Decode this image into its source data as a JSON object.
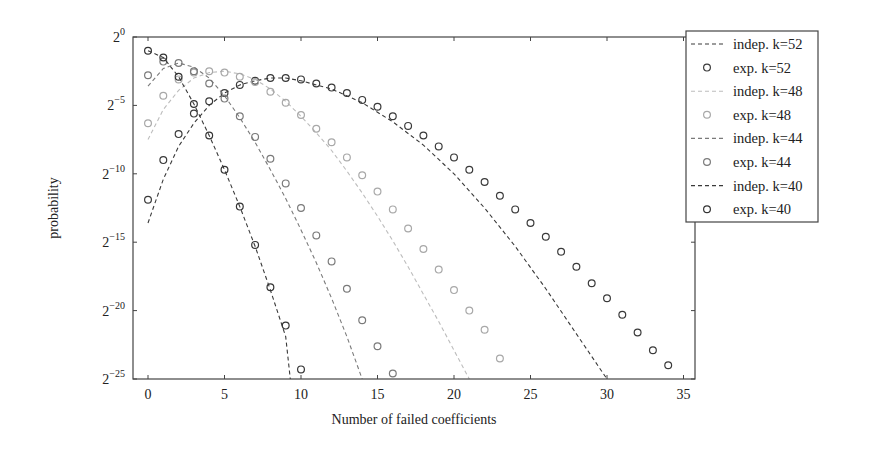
{
  "chart_data": {
    "type": "scatter",
    "title": "",
    "xlabel": "Number of failed coefficients",
    "ylabel": "probability",
    "xlim": [
      -1,
      35.5
    ],
    "ylim_log2": [
      -25,
      0
    ],
    "y_scale": "log2",
    "x_ticks": [
      0,
      5,
      10,
      15,
      20,
      25,
      30,
      35
    ],
    "y_ticks": [
      0,
      -5,
      -10,
      -15,
      -20,
      -25
    ],
    "y_tick_labels": [
      "2^0",
      "2^-5",
      "2^-10",
      "2^-15",
      "2^-20",
      "2^-25"
    ],
    "grid": false,
    "legend_position": "outside-top-right",
    "series": [
      {
        "name": "indep. k=52",
        "kind": "dashed-line",
        "color": "#3a3a3a",
        "x": [
          0,
          1,
          2,
          3,
          4,
          5,
          6,
          7,
          8,
          9,
          10,
          12,
          14,
          16,
          18,
          20,
          22,
          24,
          26,
          28,
          30
        ],
        "log2y": [
          -13.6,
          -10.4,
          -8.0,
          -6.3,
          -5.0,
          -4.1,
          -3.5,
          -3.2,
          -3.0,
          -3.0,
          -3.2,
          -3.8,
          -4.8,
          -6.2,
          -7.9,
          -10.0,
          -12.5,
          -15.3,
          -18.4,
          -21.7,
          -25.0
        ]
      },
      {
        "name": "exp. k=52",
        "kind": "circles",
        "color": "#3a3a3a",
        "x": [
          0,
          1,
          2,
          3,
          4,
          5,
          6,
          7,
          8,
          9,
          10,
          11,
          12,
          13,
          14,
          15,
          16,
          17,
          18,
          19,
          20,
          21,
          22,
          23,
          24,
          25,
          26,
          27,
          28,
          29,
          30,
          31,
          32,
          33,
          34
        ],
        "log2y": [
          -11.9,
          -9.0,
          -7.1,
          -5.6,
          -4.7,
          -4.1,
          -3.5,
          -3.2,
          -3.0,
          -3.0,
          -3.1,
          -3.4,
          -3.7,
          -4.1,
          -4.6,
          -5.1,
          -5.8,
          -6.5,
          -7.2,
          -8.0,
          -8.8,
          -9.7,
          -10.6,
          -11.6,
          -12.6,
          -13.6,
          -14.6,
          -15.7,
          -16.8,
          -18.0,
          -19.1,
          -20.3,
          -21.6,
          -22.9,
          -24.0
        ]
      },
      {
        "name": "indep. k=48",
        "kind": "dashed-line",
        "color": "#bdbdbd",
        "x": [
          0,
          1,
          2,
          3,
          4,
          5,
          6,
          7,
          8,
          9,
          10,
          11,
          12,
          13,
          14,
          15,
          16,
          17,
          18,
          19,
          20,
          21
        ],
        "log2y": [
          -7.5,
          -5.3,
          -3.9,
          -3.0,
          -2.6,
          -2.5,
          -2.7,
          -3.1,
          -3.8,
          -4.7,
          -5.8,
          -7.0,
          -8.3,
          -9.8,
          -11.4,
          -13.1,
          -14.9,
          -16.8,
          -18.8,
          -20.8,
          -22.9,
          -25.0
        ]
      },
      {
        "name": "exp. k=48",
        "kind": "circles",
        "color": "#a8a8a8",
        "x": [
          0,
          1,
          2,
          3,
          4,
          5,
          6,
          7,
          8,
          9,
          10,
          11,
          12,
          13,
          14,
          15,
          16,
          17,
          18,
          19,
          20,
          21,
          22,
          23
        ],
        "log2y": [
          -6.3,
          -4.3,
          -3.1,
          -2.6,
          -2.5,
          -2.6,
          -2.9,
          -3.3,
          -4.0,
          -4.8,
          -5.7,
          -6.7,
          -7.7,
          -8.8,
          -10.1,
          -11.3,
          -12.6,
          -14.0,
          -15.5,
          -17.0,
          -18.5,
          -20.0,
          -21.4,
          -23.5
        ]
      },
      {
        "name": "indep. k=44",
        "kind": "dashed-line",
        "color": "#7a7a7a",
        "x": [
          0,
          1,
          2,
          3,
          4,
          5,
          6,
          7,
          8,
          9,
          10,
          11,
          12,
          13,
          14
        ],
        "log2y": [
          -3.6,
          -2.3,
          -1.9,
          -2.2,
          -3.0,
          -4.3,
          -5.9,
          -7.7,
          -9.7,
          -11.8,
          -14.1,
          -16.5,
          -19.1,
          -21.9,
          -25.0
        ]
      },
      {
        "name": "exp. k=44",
        "kind": "circles",
        "color": "#7a7a7a",
        "x": [
          0,
          1,
          2,
          3,
          4,
          5,
          6,
          7,
          8,
          9,
          10,
          11,
          12,
          13,
          14,
          15,
          16
        ],
        "log2y": [
          -2.8,
          -1.8,
          -1.9,
          -2.5,
          -3.4,
          -4.5,
          -5.8,
          -7.3,
          -8.9,
          -10.7,
          -12.5,
          -14.5,
          -16.4,
          -18.4,
          -20.7,
          -22.6,
          -24.6
        ]
      },
      {
        "name": "indep. k=40",
        "kind": "dashed-line",
        "color": "#3a3a3a",
        "x": [
          0,
          1,
          2,
          3,
          4,
          5,
          6,
          7,
          8,
          9,
          9.3
        ],
        "log2y": [
          -1.0,
          -1.5,
          -2.9,
          -4.9,
          -7.2,
          -9.7,
          -12.4,
          -15.3,
          -18.5,
          -21.9,
          -25.0
        ]
      },
      {
        "name": "exp. k=40",
        "kind": "circles",
        "color": "#333333",
        "x": [
          0,
          1,
          2,
          3,
          4,
          5,
          6,
          7,
          8,
          9,
          10
        ],
        "log2y": [
          -1.0,
          -1.5,
          -2.9,
          -4.9,
          -7.2,
          -9.7,
          -12.4,
          -15.2,
          -18.3,
          -21.1,
          -24.3
        ]
      }
    ]
  },
  "legend": {
    "items": [
      {
        "label": "indep. k=52",
        "marker": "dashed",
        "color": "#3a3a3a"
      },
      {
        "label": "exp. k=52",
        "marker": "circle",
        "color": "#3a3a3a"
      },
      {
        "label": "indep. k=48",
        "marker": "dashed",
        "color": "#bdbdbd"
      },
      {
        "label": "exp. k=48",
        "marker": "circle",
        "color": "#a8a8a8"
      },
      {
        "label": "indep. k=44",
        "marker": "dashed",
        "color": "#7a7a7a"
      },
      {
        "label": "exp. k=44",
        "marker": "circle",
        "color": "#7a7a7a"
      },
      {
        "label": "indep. k=40",
        "marker": "dashed",
        "color": "#3a3a3a"
      },
      {
        "label": "exp. k=40",
        "marker": "circle",
        "color": "#333333"
      }
    ]
  },
  "axes": {
    "x_label": "Number of failed coefficients",
    "y_label": "probability"
  }
}
